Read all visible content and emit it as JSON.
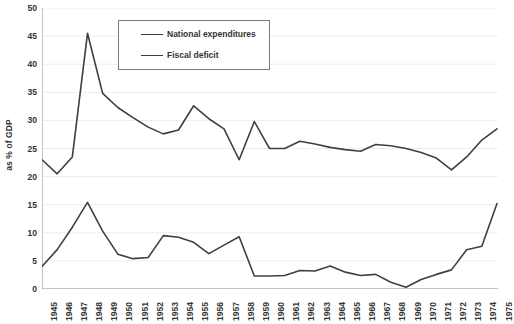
{
  "chart_data": {
    "type": "line",
    "title": "",
    "xlabel": "",
    "ylabel": "as % of GDP",
    "ylim": [
      0,
      50
    ],
    "ytick_step": 5,
    "yticks": [
      0,
      5,
      10,
      15,
      20,
      25,
      30,
      35,
      40,
      45,
      50
    ],
    "ytick_labels": [
      "0",
      "5",
      "10",
      "15",
      "20",
      "25",
      "30",
      "35",
      "40",
      "45",
      "50"
    ],
    "grid": true,
    "grid_axis": "y",
    "legend_position": "upper-center",
    "categories": [
      "1945",
      "1946",
      "1947",
      "1948",
      "1949",
      "1950",
      "1951",
      "1952",
      "1953",
      "1954",
      "1955",
      "1956",
      "1957",
      "1958",
      "1959",
      "1960",
      "1961",
      "1962",
      "1963",
      "1964",
      "1965",
      "1966",
      "1967",
      "1968",
      "1969",
      "1970",
      "1971",
      "1972",
      "1973",
      "1974",
      "1975"
    ],
    "series": [
      {
        "name": "National expenditures",
        "color": "#3f3f3f",
        "values": [
          23.0,
          20.5,
          23.5,
          45.5,
          34.8,
          32.3,
          30.5,
          28.8,
          27.6,
          28.3,
          32.6,
          30.3,
          28.5,
          23.0,
          29.8,
          25.0,
          25.0,
          26.3,
          25.8,
          25.2,
          24.8,
          24.5,
          25.7,
          25.5,
          25.0,
          24.3,
          23.3,
          21.2,
          23.5,
          26.5,
          28.5
        ]
      },
      {
        "name": "Fiscal deficit",
        "color": "#3f3f3f",
        "values": [
          4.0,
          7.0,
          11.0,
          15.4,
          10.3,
          6.2,
          5.4,
          5.6,
          9.5,
          9.2,
          8.3,
          6.3,
          7.8,
          9.3,
          2.3,
          2.3,
          2.4,
          3.3,
          3.2,
          4.1,
          3.0,
          2.4,
          2.6,
          1.2,
          0.3,
          1.7,
          2.6,
          3.4,
          7.0,
          7.6,
          15.2
        ]
      }
    ]
  },
  "legend": {
    "entries": [
      {
        "label": "National expenditures"
      },
      {
        "label": "Fiscal deficit"
      }
    ]
  },
  "axes": {
    "y_title": "as % of GDP"
  }
}
